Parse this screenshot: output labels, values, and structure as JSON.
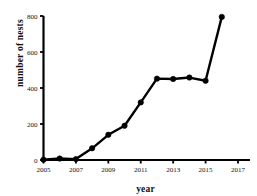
{
  "chart_data": {
    "type": "line",
    "title": "",
    "xlabel": "year",
    "ylabel": "number of nests",
    "xlim": [
      2005,
      2017
    ],
    "ylim": [
      0,
      800
    ],
    "xticks": [
      2005,
      2007,
      2009,
      2011,
      2013,
      2015,
      2017
    ],
    "xtick_labels": [
      "2005",
      "2007",
      "2009",
      "2011",
      "2013",
      "2015",
      "2017"
    ],
    "yticks": [
      0,
      200,
      400,
      600,
      800
    ],
    "ytick_labels": [
      "0",
      "200",
      "400",
      "600",
      "800"
    ],
    "grid": false,
    "legend": null,
    "marker": "filled-circle",
    "line_color": "#000000",
    "marker_color": "#000000",
    "x": [
      2005,
      2006,
      2007,
      2008,
      2009,
      2010,
      2011,
      2012,
      2013,
      2014,
      2015,
      2016
    ],
    "values": [
      2,
      8,
      5,
      65,
      140,
      190,
      320,
      452,
      450,
      458,
      440,
      795
    ],
    "series": [
      {
        "name": "number of nests",
        "x": [
          2005,
          2006,
          2007,
          2008,
          2009,
          2010,
          2011,
          2012,
          2013,
          2014,
          2015,
          2016
        ],
        "values": [
          2,
          8,
          5,
          65,
          140,
          190,
          320,
          452,
          450,
          458,
          440,
          795
        ]
      }
    ],
    "annotations": []
  },
  "axes": {
    "y_axis_title": "number of nests",
    "x_axis_title": "year"
  }
}
